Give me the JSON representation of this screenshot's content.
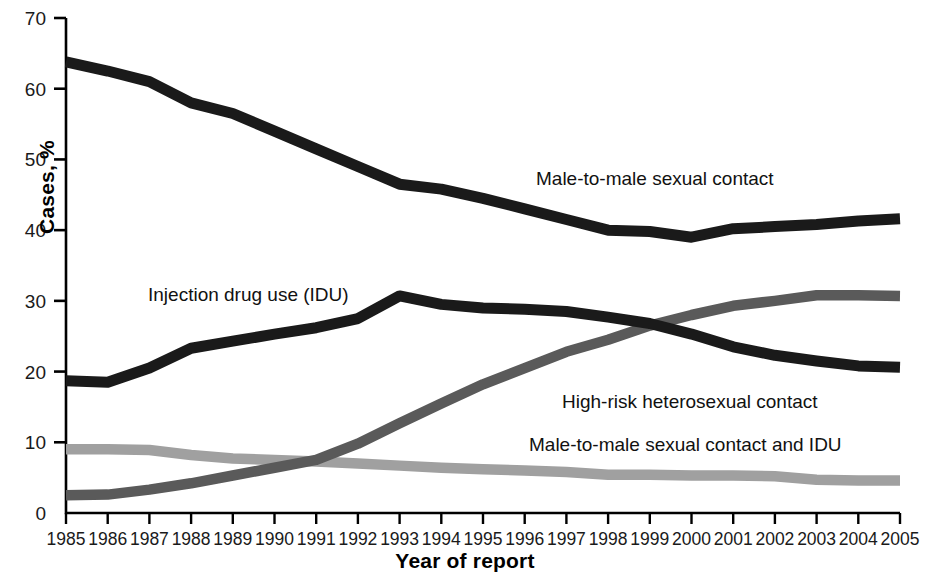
{
  "chart_data": {
    "type": "line",
    "title": "",
    "xlabel": "Year of report",
    "ylabel": "Cases, %",
    "xlim": [
      1985,
      2005
    ],
    "ylim": [
      0,
      70
    ],
    "ytick_labels": [
      "0",
      "10",
      "20",
      "30",
      "40",
      "50",
      "60",
      "70"
    ],
    "yticks": [
      0,
      10,
      20,
      30,
      40,
      50,
      60,
      70
    ],
    "grid": false,
    "legend_position": "inline-annotations",
    "x": [
      1985,
      1986,
      1987,
      1988,
      1989,
      1990,
      1991,
      1992,
      1993,
      1994,
      1995,
      1996,
      1997,
      1998,
      1999,
      2000,
      2001,
      2002,
      2003,
      2004,
      2005
    ],
    "xtick_labels": [
      "1985",
      "1986",
      "1987",
      "1988",
      "1989",
      "1990",
      "1991",
      "1992",
      "1993",
      "1994",
      "1995",
      "1996",
      "1997",
      "1998",
      "1999",
      "2000",
      "2001",
      "2002",
      "2003",
      "2004",
      "2005"
    ],
    "series": [
      {
        "name": "Male-to-male sexual contact",
        "color": "#1a1a1a",
        "values": [
          63.8,
          62.5,
          61.0,
          58.0,
          56.5,
          54.0,
          51.5,
          49.0,
          46.5,
          45.8,
          44.5,
          43.0,
          41.5,
          40.0,
          39.8,
          39.0,
          40.2,
          40.5,
          40.8,
          41.3,
          41.6
        ]
      },
      {
        "name": "Injection drug use (IDU)",
        "color": "#1a1a1a",
        "values": [
          18.7,
          18.5,
          20.5,
          23.3,
          24.3,
          25.3,
          26.2,
          27.5,
          30.7,
          29.5,
          29.0,
          28.8,
          28.5,
          27.7,
          26.8,
          25.3,
          23.5,
          22.3,
          21.5,
          20.8,
          20.6
        ]
      },
      {
        "name": "High-risk heterosexual contact",
        "color": "#5a5a5a",
        "values": [
          2.5,
          2.6,
          3.3,
          4.2,
          5.3,
          6.4,
          7.5,
          9.8,
          12.7,
          15.5,
          18.2,
          20.5,
          22.8,
          24.5,
          26.5,
          28.0,
          29.3,
          30.0,
          30.8,
          30.8,
          30.7
        ]
      },
      {
        "name": "Male-to-male sexual contact and IDU",
        "color": "#a0a0a0",
        "values": [
          9.0,
          9.0,
          8.9,
          8.2,
          7.7,
          7.5,
          7.3,
          7.0,
          6.7,
          6.4,
          6.2,
          6.0,
          5.8,
          5.4,
          5.4,
          5.3,
          5.3,
          5.2,
          4.7,
          4.6,
          4.6
        ]
      }
    ],
    "annotations": [
      {
        "text": "Male-to-male sexual contact",
        "x": 536,
        "y": 185
      },
      {
        "text": "Injection drug use (IDU)",
        "x": 148,
        "y": 301
      },
      {
        "text": "High-risk heterosexual contact",
        "x": 562,
        "y": 408
      },
      {
        "text": "Male-to-male sexual contact and IDU",
        "x": 529,
        "y": 451
      }
    ]
  }
}
